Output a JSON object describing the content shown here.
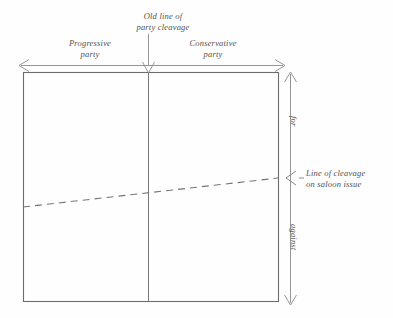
{
  "figure": {
    "type": "diagram",
    "title": "Old line of party cleavage",
    "background_color": "#fefefe",
    "line_color": "#6b6b6b",
    "text_color": "#53514f"
  },
  "labels": {
    "old_line_of_party_cleavage": "Old line of\nparty cleavage",
    "old_line_of_party_cleavage_l1": "Old line of",
    "old_line_of_party_cleavage_l2": "party cleavage",
    "progressive_party": "Progressive\nparty",
    "progressive_party_l1": "Progressive",
    "progressive_party_l2": "party",
    "conservative_party": "Conservative\nparty",
    "conservative_party_l1": "Conservative",
    "conservative_party_l2": "party",
    "line_of_cleavage_on_saloon_issue": "Line of cleavage\non saloon issue",
    "line_of_cleavage_l1": "Line of cleavage",
    "line_of_cleavage_l2": "on saloon issue",
    "for": "for",
    "against": "against"
  },
  "geometry": {
    "rect": {
      "x": 23,
      "y": 72,
      "width": 255,
      "height": 229
    },
    "vertical_divider_x": 148,
    "horizontal_axis_y": 65,
    "horizontal_axis_x1": 19,
    "horizontal_axis_x2": 285,
    "vertical_axis_x": 290,
    "vertical_axis_y1": 72,
    "vertical_axis_y2": 305,
    "cleavage_line_left": {
      "x": 23,
      "y": 207
    },
    "cleavage_line_right": {
      "x": 278,
      "y": 178
    },
    "cleavage_marker_y": 178
  }
}
